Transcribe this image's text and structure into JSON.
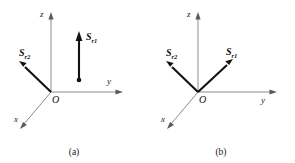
{
  "figure": {
    "background_color": "#ffffff",
    "axis_color": "#8c8c8c",
    "vector_color": "#121212",
    "label_color": "#111111"
  },
  "panels": [
    {
      "id": "a",
      "caption": "(a)",
      "origin_label": "O",
      "axes": [
        {
          "name": "z",
          "label": "z",
          "direction": "up"
        },
        {
          "name": "y",
          "label": "y",
          "direction": "right"
        },
        {
          "name": "x",
          "label": "x",
          "direction": "down-left"
        }
      ],
      "vectors": [
        {
          "name": "S_r1",
          "symbol": "S",
          "subscript": "r",
          "index": "1",
          "direction": "up",
          "origin_attached": false,
          "has_base_dot": true
        },
        {
          "name": "S_r2",
          "symbol": "S",
          "subscript": "r",
          "index": "2",
          "direction": "up-left",
          "origin_attached": true,
          "has_base_dot": false
        }
      ]
    },
    {
      "id": "b",
      "caption": "(b)",
      "origin_label": "O",
      "axes": [
        {
          "name": "z",
          "label": "z",
          "direction": "up"
        },
        {
          "name": "y",
          "label": "y",
          "direction": "right"
        },
        {
          "name": "x",
          "label": "x",
          "direction": "down-left"
        }
      ],
      "vectors": [
        {
          "name": "S_r1",
          "symbol": "S",
          "subscript": "r",
          "index": "1",
          "direction": "up-right",
          "origin_attached": true,
          "has_base_dot": false
        },
        {
          "name": "S_r2",
          "symbol": "S",
          "subscript": "r",
          "index": "2",
          "direction": "up-left",
          "origin_attached": true,
          "has_base_dot": false
        }
      ]
    }
  ]
}
